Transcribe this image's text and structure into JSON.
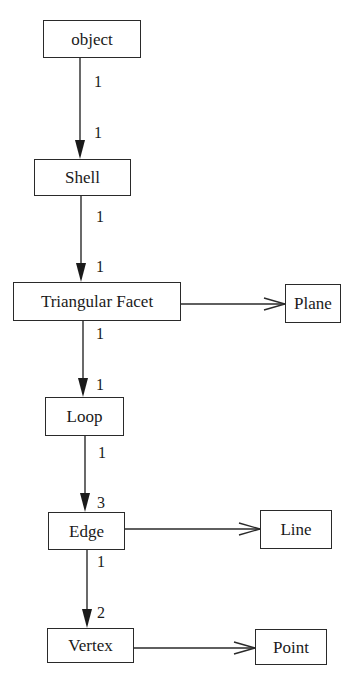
{
  "diagram": {
    "type": "class-hierarchy",
    "nodes": [
      {
        "id": "object",
        "label": "object"
      },
      {
        "id": "shell",
        "label": "Shell"
      },
      {
        "id": "triangular_facet",
        "label": "Triangular Facet"
      },
      {
        "id": "plane",
        "label": "Plane"
      },
      {
        "id": "loop",
        "label": "Loop"
      },
      {
        "id": "edge",
        "label": "Edge"
      },
      {
        "id": "line",
        "label": "Line"
      },
      {
        "id": "vertex",
        "label": "Vertex"
      },
      {
        "id": "point",
        "label": "Point"
      }
    ],
    "edges": [
      {
        "from": "object",
        "to": "shell",
        "kind": "composition",
        "source_multiplicity": "1",
        "target_multiplicity": "1"
      },
      {
        "from": "shell",
        "to": "triangular_facet",
        "kind": "composition",
        "source_multiplicity": "1",
        "target_multiplicity": "1"
      },
      {
        "from": "triangular_facet",
        "to": "loop",
        "kind": "composition",
        "source_multiplicity": "1",
        "target_multiplicity": "1"
      },
      {
        "from": "loop",
        "to": "edge",
        "kind": "composition",
        "source_multiplicity": "1",
        "target_multiplicity": "3"
      },
      {
        "from": "edge",
        "to": "vertex",
        "kind": "composition",
        "source_multiplicity": "1",
        "target_multiplicity": "2"
      },
      {
        "from": "triangular_facet",
        "to": "plane",
        "kind": "association"
      },
      {
        "from": "edge",
        "to": "line",
        "kind": "association"
      },
      {
        "from": "vertex",
        "to": "point",
        "kind": "association"
      }
    ]
  },
  "labels": {
    "object": "object",
    "shell": "Shell",
    "triangular_facet": "Triangular Facet",
    "plane": "Plane",
    "loop": "Loop",
    "edge": "Edge",
    "line": "Line",
    "vertex": "Vertex",
    "point": "Point"
  },
  "multiplicities": {
    "object_shell_src": "1",
    "object_shell_tgt": "1",
    "shell_facet_src": "1",
    "shell_facet_tgt": "1",
    "facet_loop_src": "1",
    "facet_loop_tgt": "1",
    "loop_edge_src": "1",
    "loop_edge_tgt": "3",
    "edge_vertex_src": "1",
    "edge_vertex_tgt": "2"
  },
  "colors": {
    "stroke": "#2a2a2a",
    "background": "#ffffff",
    "text": "#1a1a1a"
  }
}
